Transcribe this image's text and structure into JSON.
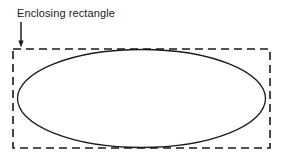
{
  "figure": {
    "kind": "geometry-diagram",
    "background_color": "#ffffff",
    "stroke_color": "#1a1a1a",
    "annotation": {
      "label": "Enclosing rectangle",
      "label_x": 17,
      "label_y": 17,
      "font_size_px": 11,
      "arrow": {
        "name": "pointer-arrow",
        "from_x": 21,
        "from_y": 22,
        "to_x": 21,
        "to_y": 47,
        "direction": "down",
        "head_width": 5,
        "head_length": 6
      }
    },
    "rectangle": {
      "name": "enclosing-rectangle",
      "style": "dashed",
      "x": 13,
      "y": 49,
      "width": 257,
      "height": 99,
      "stroke_width": 1.6,
      "dash_length": 8,
      "dash_gap": 5,
      "fill": "none"
    },
    "ellipse": {
      "name": "inscribed-ellipse",
      "style": "solid",
      "center_x": 141.5,
      "center_y": 98.5,
      "radius_x": 124,
      "radius_y": 49,
      "stroke_width": 1.3,
      "fill": "none"
    }
  }
}
